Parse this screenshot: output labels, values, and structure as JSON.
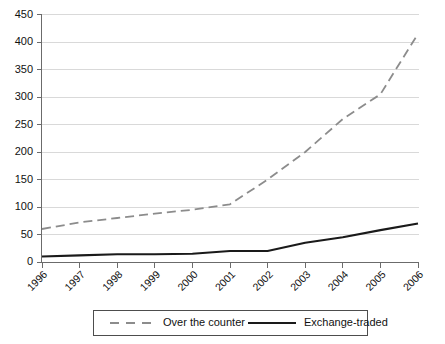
{
  "chart_data": {
    "type": "line",
    "title": "",
    "xlabel": "",
    "ylabel": "",
    "categories": [
      "1996",
      "1997",
      "1998",
      "1999",
      "2000",
      "2001",
      "2002",
      "2003",
      "2004",
      "2005",
      "2006"
    ],
    "ylim": [
      0,
      450
    ],
    "ytick_values": [
      0,
      50,
      100,
      150,
      200,
      250,
      300,
      350,
      400,
      450
    ],
    "ytick_labels": [
      "0",
      "50",
      "100",
      "150",
      "200",
      "250",
      "300",
      "350",
      "400",
      "450"
    ],
    "grid": "horizontal",
    "legend_position": "bottom",
    "series": [
      {
        "name": "Over the counter",
        "style": "dashed",
        "color": "#8c8c8c",
        "values": [
          60,
          72,
          80,
          88,
          95,
          105,
          150,
          200,
          260,
          305,
          415
        ]
      },
      {
        "name": "Exchange-traded",
        "style": "solid",
        "color": "#1a1a1a",
        "values": [
          10,
          12,
          14,
          14,
          15,
          20,
          20,
          35,
          45,
          58,
          70
        ]
      }
    ]
  },
  "legend": {
    "items": [
      {
        "label": "Over the counter"
      },
      {
        "label": "Exchange-traded"
      }
    ]
  },
  "colors": {
    "otc_line": "#8c8c8c",
    "exchange_line": "#1a1a1a",
    "gridline": "#d9d9d9",
    "axis": "#6b6b6b",
    "background": "#ffffff"
  }
}
